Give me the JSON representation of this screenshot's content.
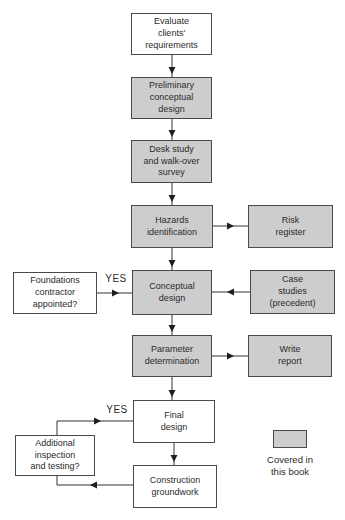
{
  "diagram": {
    "type": "flowchart",
    "legend": {
      "label": "Covered in\nthis book"
    },
    "nodes": [
      {
        "id": "evaluate-clients-requirements",
        "label": "Evaluate\nclients'\nrequirements",
        "covered": false
      },
      {
        "id": "preliminary-conceptual-design",
        "label": "Preliminary\nconceptual\ndesign",
        "covered": true
      },
      {
        "id": "desk-study-walk-over-survey",
        "label": "Desk study\nand walk-over\nsurvey",
        "covered": true
      },
      {
        "id": "hazards-identification",
        "label": "Hazards\nidentification",
        "covered": true
      },
      {
        "id": "risk-register",
        "label": "Risk\nregister",
        "covered": true
      },
      {
        "id": "foundations-contractor-appointed",
        "label": "Foundations\ncontractor\nappointed?",
        "covered": false
      },
      {
        "id": "conceptual-design",
        "label": "Conceptual\ndesign",
        "covered": true
      },
      {
        "id": "case-studies-precedent",
        "label": "Case\nstudies\n(precedent)",
        "covered": true
      },
      {
        "id": "parameter-determination",
        "label": "Parameter\ndetermination",
        "covered": true
      },
      {
        "id": "write-report",
        "label": "Write\nreport",
        "covered": true
      },
      {
        "id": "final-design",
        "label": "Final\ndesign",
        "covered": false
      },
      {
        "id": "construction-groundwork",
        "label": "Construction\ngroundwork",
        "covered": false
      },
      {
        "id": "additional-inspection-testing",
        "label": "Additional\ninspection\nand testing?",
        "covered": false
      }
    ],
    "edges": [
      {
        "from": "evaluate-clients-requirements",
        "to": "preliminary-conceptual-design",
        "label": ""
      },
      {
        "from": "preliminary-conceptual-design",
        "to": "desk-study-walk-over-survey",
        "label": ""
      },
      {
        "from": "desk-study-walk-over-survey",
        "to": "hazards-identification",
        "label": ""
      },
      {
        "from": "hazards-identification",
        "to": "conceptual-design",
        "label": ""
      },
      {
        "from": "hazards-identification",
        "to": "risk-register",
        "label": ""
      },
      {
        "from": "case-studies-precedent",
        "to": "conceptual-design",
        "label": ""
      },
      {
        "from": "foundations-contractor-appointed",
        "to": "conceptual-design",
        "label": "YES"
      },
      {
        "from": "conceptual-design",
        "to": "parameter-determination",
        "label": ""
      },
      {
        "from": "parameter-determination",
        "to": "write-report",
        "label": ""
      },
      {
        "from": "parameter-determination",
        "to": "final-design",
        "label": ""
      },
      {
        "from": "final-design",
        "to": "construction-groundwork",
        "label": ""
      },
      {
        "from": "construction-groundwork",
        "to": "additional-inspection-testing",
        "label": ""
      },
      {
        "from": "additional-inspection-testing",
        "to": "final-design",
        "label": "YES"
      }
    ],
    "colors": {
      "covered_fill": "#cdcdcd",
      "uncovered_fill": "#ffffff",
      "border": "#4a4a4a",
      "line": "#333333",
      "text": "#2b2b2b",
      "background": "#ffffff"
    }
  }
}
